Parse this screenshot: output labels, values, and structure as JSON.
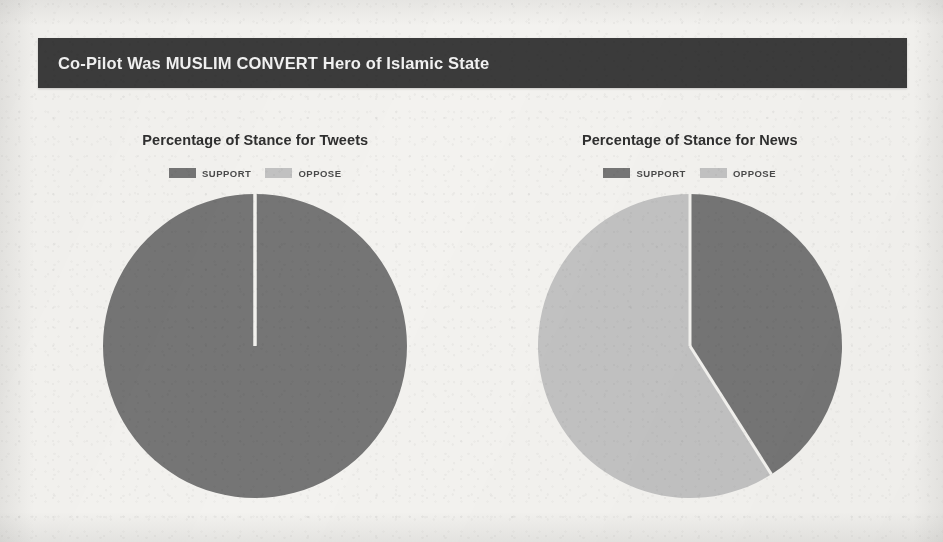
{
  "headline": {
    "text": "Co-Pilot Was MUSLIM CONVERT Hero of Islamic State"
  },
  "colors": {
    "headline_bar": "#3b3b3b",
    "headline_text": "#f2f2f2",
    "page_background": "#f3f2ef",
    "support": "#757575",
    "oppose": "#c2c2c2",
    "slice_divider": "#f3f2ef",
    "chart_title": "#2f2f2f"
  },
  "charts": [
    {
      "id": "tweets",
      "title": "Percentage of Stance for Tweets",
      "legend": [
        {
          "label": "SUPPORT",
          "color": "#757575"
        },
        {
          "label": "OPPOSE",
          "color": "#c2c2c2"
        }
      ]
    },
    {
      "id": "news",
      "title": "Percentage of Stance for News",
      "legend": [
        {
          "label": "SUPPORT",
          "color": "#757575"
        },
        {
          "label": "OPPOSE",
          "color": "#c2c2c2"
        }
      ]
    }
  ],
  "chart_data": [
    {
      "type": "pie",
      "id": "tweets",
      "title": "Percentage of Stance for Tweets",
      "categories": [
        "SUPPORT",
        "OPPOSE"
      ],
      "values": [
        100,
        0
      ],
      "unit": "percent",
      "colors": [
        "#757575",
        "#c2c2c2"
      ],
      "start_angle_deg": 0,
      "direction": "clockwise",
      "legend_position": "top",
      "grid": false,
      "notes": "Single dark slice spans the full circle; a hairline radius is drawn at 12 o'clock where the zero-size OPPOSE slice sits."
    },
    {
      "type": "pie",
      "id": "news",
      "title": "Percentage of Stance for News",
      "categories": [
        "SUPPORT",
        "OPPOSE"
      ],
      "values": [
        41,
        59
      ],
      "unit": "percent",
      "colors": [
        "#757575",
        "#c2c2c2"
      ],
      "start_angle_deg": 0,
      "direction": "clockwise",
      "legend_position": "top",
      "grid": false,
      "notes": "Dark SUPPORT wedge runs clockwise from 12 o'clock to about 148 degrees; light OPPOSE wedge fills the remainder."
    }
  ]
}
